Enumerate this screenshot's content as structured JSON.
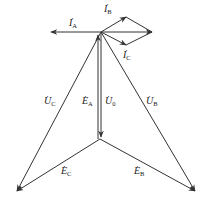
{
  "diagram": {
    "colors": {
      "line": "#333333",
      "background": "#ffffff"
    },
    "labels": {
      "IA": {
        "symbol": "I",
        "sub": "A",
        "dot": "·"
      },
      "IB": {
        "symbol": "I",
        "sub": "B",
        "dot": "·"
      },
      "IC": {
        "symbol": "I",
        "sub": "C",
        "dot": "·"
      },
      "UC": {
        "symbol": "U",
        "sub": "C",
        "dot": "·"
      },
      "EA": {
        "symbol": "E",
        "sub": "A",
        "dot": "·"
      },
      "U0": {
        "symbol": "U",
        "sub": "0",
        "dot": "·"
      },
      "UB": {
        "symbol": "U",
        "sub": "B",
        "dot": "·"
      },
      "EC": {
        "symbol": "E",
        "sub": "C",
        "dot": "·"
      },
      "EB": {
        "symbol": "E",
        "sub": "B",
        "dot": "·"
      }
    }
  }
}
